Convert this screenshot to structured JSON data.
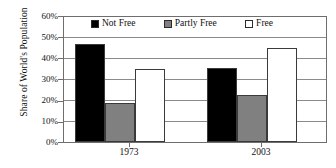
{
  "chart_data": {
    "type": "bar",
    "title": "",
    "xlabel": "",
    "ylabel": "Share of World's Population",
    "categories": [
      "1973",
      "2003"
    ],
    "series": [
      {
        "name": "Not Free",
        "color": "#000000",
        "values": [
          47,
          35.5
        ]
      },
      {
        "name": "Partly Free",
        "color": "#808080",
        "values": [
          18.5,
          22.5
        ]
      },
      {
        "name": "Free",
        "color": "#ffffff",
        "values": [
          35,
          45
        ]
      }
    ],
    "ylim": [
      0,
      60
    ],
    "ytick_labels": [
      "0%",
      "10%",
      "20%",
      "30%",
      "40%",
      "50%",
      "60%"
    ],
    "ytick_values": [
      0,
      10,
      20,
      30,
      40,
      50,
      60
    ],
    "grid": true,
    "legend_position": "top-center"
  }
}
